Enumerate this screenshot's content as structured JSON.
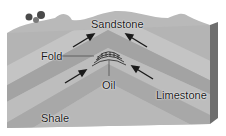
{
  "diagram": {
    "labels": {
      "sandstone": "Sandstone",
      "fold": "Fold",
      "oil": "Oil",
      "limestone": "Limestone",
      "shale": "Shale"
    },
    "colors": {
      "background": "#ffffff",
      "top_surface": "#b9b9b9",
      "layer_light": "#c4c4c4",
      "layer_mid": "#adadad",
      "layer_dark": "#9f9f9f",
      "side_face": "#6e6e6e",
      "arrow": "#1a1a1a",
      "tree": "#4a4a4a"
    },
    "arrows": [
      {
        "from": [
          73,
          47
        ],
        "to": [
          93,
          35
        ],
        "meaning": "compression-force"
      },
      {
        "from": [
          147,
          47
        ],
        "to": [
          127,
          35
        ],
        "meaning": "compression-force"
      },
      {
        "from": [
          65,
          83
        ],
        "to": [
          86,
          70
        ],
        "meaning": "compression-force"
      },
      {
        "from": [
          153,
          79
        ],
        "to": [
          132,
          66
        ],
        "meaning": "compression-force"
      }
    ]
  }
}
